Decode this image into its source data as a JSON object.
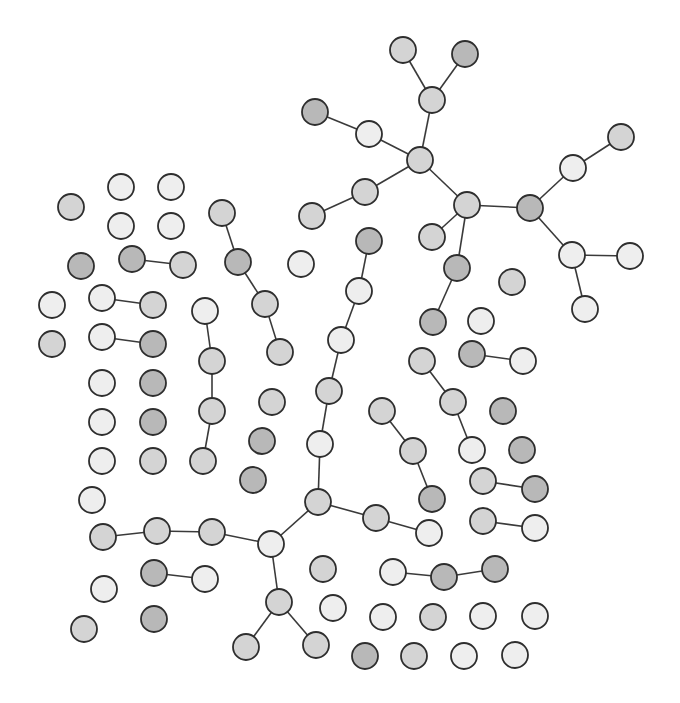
{
  "diagram": {
    "type": "network-graph",
    "width": 680,
    "height": 703,
    "node_radius": 13,
    "shades": {
      "light": "#eeeeee",
      "mid": "#d4d4d4",
      "dark": "#b8b8b8"
    },
    "nodes": [
      {
        "id": "n1",
        "x": 403,
        "y": 50,
        "shade": "mid"
      },
      {
        "id": "n2",
        "x": 465,
        "y": 54,
        "shade": "dark"
      },
      {
        "id": "n3",
        "x": 432,
        "y": 100,
        "shade": "mid"
      },
      {
        "id": "n4",
        "x": 315,
        "y": 112,
        "shade": "dark"
      },
      {
        "id": "n5",
        "x": 369,
        "y": 134,
        "shade": "light"
      },
      {
        "id": "n6",
        "x": 420,
        "y": 160,
        "shade": "mid"
      },
      {
        "id": "n7",
        "x": 621,
        "y": 137,
        "shade": "mid"
      },
      {
        "id": "n8",
        "x": 573,
        "y": 168,
        "shade": "light"
      },
      {
        "id": "n9",
        "x": 365,
        "y": 192,
        "shade": "mid"
      },
      {
        "id": "n10",
        "x": 467,
        "y": 205,
        "shade": "mid"
      },
      {
        "id": "n11",
        "x": 530,
        "y": 208,
        "shade": "dark"
      },
      {
        "id": "n12",
        "x": 312,
        "y": 216,
        "shade": "mid"
      },
      {
        "id": "n13",
        "x": 432,
        "y": 237,
        "shade": "mid"
      },
      {
        "id": "n14",
        "x": 572,
        "y": 255,
        "shade": "light"
      },
      {
        "id": "n15",
        "x": 630,
        "y": 256,
        "shade": "light"
      },
      {
        "id": "n16",
        "x": 457,
        "y": 268,
        "shade": "dark"
      },
      {
        "id": "n17",
        "x": 512,
        "y": 282,
        "shade": "mid"
      },
      {
        "id": "n18",
        "x": 585,
        "y": 309,
        "shade": "light"
      },
      {
        "id": "n19",
        "x": 433,
        "y": 322,
        "shade": "dark"
      },
      {
        "id": "n20",
        "x": 481,
        "y": 321,
        "shade": "light"
      },
      {
        "id": "n21",
        "x": 121,
        "y": 187,
        "shade": "light"
      },
      {
        "id": "n22",
        "x": 171,
        "y": 187,
        "shade": "light"
      },
      {
        "id": "n23",
        "x": 71,
        "y": 207,
        "shade": "mid"
      },
      {
        "id": "n24",
        "x": 121,
        "y": 226,
        "shade": "light"
      },
      {
        "id": "n25",
        "x": 171,
        "y": 226,
        "shade": "light"
      },
      {
        "id": "n26",
        "x": 222,
        "y": 213,
        "shade": "mid"
      },
      {
        "id": "n27",
        "x": 369,
        "y": 241,
        "shade": "dark"
      },
      {
        "id": "n28",
        "x": 81,
        "y": 266,
        "shade": "dark"
      },
      {
        "id": "n29",
        "x": 132,
        "y": 259,
        "shade": "dark"
      },
      {
        "id": "n30",
        "x": 183,
        "y": 265,
        "shade": "mid"
      },
      {
        "id": "n31",
        "x": 238,
        "y": 262,
        "shade": "dark"
      },
      {
        "id": "n32",
        "x": 301,
        "y": 264,
        "shade": "light"
      },
      {
        "id": "n33",
        "x": 359,
        "y": 291,
        "shade": "light"
      },
      {
        "id": "n34",
        "x": 52,
        "y": 305,
        "shade": "light"
      },
      {
        "id": "n35",
        "x": 102,
        "y": 298,
        "shade": "light"
      },
      {
        "id": "n36",
        "x": 153,
        "y": 305,
        "shade": "mid"
      },
      {
        "id": "n37",
        "x": 265,
        "y": 304,
        "shade": "mid"
      },
      {
        "id": "n38",
        "x": 205,
        "y": 311,
        "shade": "light"
      },
      {
        "id": "n39",
        "x": 52,
        "y": 344,
        "shade": "mid"
      },
      {
        "id": "n40",
        "x": 102,
        "y": 337,
        "shade": "light"
      },
      {
        "id": "n41",
        "x": 153,
        "y": 344,
        "shade": "dark"
      },
      {
        "id": "n42",
        "x": 341,
        "y": 340,
        "shade": "light"
      },
      {
        "id": "n43",
        "x": 280,
        "y": 352,
        "shade": "mid"
      },
      {
        "id": "n44",
        "x": 422,
        "y": 361,
        "shade": "mid"
      },
      {
        "id": "n45",
        "x": 472,
        "y": 354,
        "shade": "dark"
      },
      {
        "id": "n46",
        "x": 523,
        "y": 361,
        "shade": "light"
      },
      {
        "id": "n47",
        "x": 212,
        "y": 361,
        "shade": "mid"
      },
      {
        "id": "n48",
        "x": 102,
        "y": 383,
        "shade": "light"
      },
      {
        "id": "n49",
        "x": 153,
        "y": 383,
        "shade": "dark"
      },
      {
        "id": "n50",
        "x": 329,
        "y": 391,
        "shade": "mid"
      },
      {
        "id": "n51",
        "x": 272,
        "y": 402,
        "shade": "mid"
      },
      {
        "id": "n52",
        "x": 453,
        "y": 402,
        "shade": "mid"
      },
      {
        "id": "n53",
        "x": 382,
        "y": 411,
        "shade": "mid"
      },
      {
        "id": "n54",
        "x": 503,
        "y": 411,
        "shade": "dark"
      },
      {
        "id": "n55",
        "x": 212,
        "y": 411,
        "shade": "mid"
      },
      {
        "id": "n56",
        "x": 102,
        "y": 422,
        "shade": "light"
      },
      {
        "id": "n57",
        "x": 153,
        "y": 422,
        "shade": "dark"
      },
      {
        "id": "n58",
        "x": 262,
        "y": 441,
        "shade": "dark"
      },
      {
        "id": "n59",
        "x": 413,
        "y": 451,
        "shade": "mid"
      },
      {
        "id": "n60",
        "x": 320,
        "y": 444,
        "shade": "light"
      },
      {
        "id": "n61",
        "x": 522,
        "y": 450,
        "shade": "dark"
      },
      {
        "id": "n62",
        "x": 102,
        "y": 461,
        "shade": "light"
      },
      {
        "id": "n63",
        "x": 153,
        "y": 461,
        "shade": "mid"
      },
      {
        "id": "n64",
        "x": 203,
        "y": 461,
        "shade": "mid"
      },
      {
        "id": "n65",
        "x": 472,
        "y": 450,
        "shade": "light"
      },
      {
        "id": "n66",
        "x": 253,
        "y": 480,
        "shade": "dark"
      },
      {
        "id": "n67",
        "x": 483,
        "y": 481,
        "shade": "mid"
      },
      {
        "id": "n68",
        "x": 535,
        "y": 489,
        "shade": "dark"
      },
      {
        "id": "n69",
        "x": 92,
        "y": 500,
        "shade": "light"
      },
      {
        "id": "n70",
        "x": 318,
        "y": 502,
        "shade": "mid"
      },
      {
        "id": "n71",
        "x": 432,
        "y": 499,
        "shade": "dark"
      },
      {
        "id": "n72",
        "x": 376,
        "y": 518,
        "shade": "mid"
      },
      {
        "id": "n73",
        "x": 483,
        "y": 521,
        "shade": "mid"
      },
      {
        "id": "n74",
        "x": 535,
        "y": 528,
        "shade": "light"
      },
      {
        "id": "n75",
        "x": 103,
        "y": 537,
        "shade": "mid"
      },
      {
        "id": "n76",
        "x": 157,
        "y": 531,
        "shade": "mid"
      },
      {
        "id": "n77",
        "x": 212,
        "y": 532,
        "shade": "mid"
      },
      {
        "id": "n78",
        "x": 429,
        "y": 533,
        "shade": "light"
      },
      {
        "id": "n79",
        "x": 271,
        "y": 544,
        "shade": "light"
      },
      {
        "id": "n80",
        "x": 154,
        "y": 573,
        "shade": "dark"
      },
      {
        "id": "n81",
        "x": 205,
        "y": 579,
        "shade": "light"
      },
      {
        "id": "n82",
        "x": 323,
        "y": 569,
        "shade": "mid"
      },
      {
        "id": "n83",
        "x": 393,
        "y": 572,
        "shade": "light"
      },
      {
        "id": "n84",
        "x": 444,
        "y": 577,
        "shade": "dark"
      },
      {
        "id": "n85",
        "x": 495,
        "y": 569,
        "shade": "dark"
      },
      {
        "id": "n86",
        "x": 104,
        "y": 589,
        "shade": "light"
      },
      {
        "id": "n87",
        "x": 279,
        "y": 602,
        "shade": "mid"
      },
      {
        "id": "n88",
        "x": 333,
        "y": 608,
        "shade": "light"
      },
      {
        "id": "n89",
        "x": 383,
        "y": 617,
        "shade": "light"
      },
      {
        "id": "n90",
        "x": 433,
        "y": 617,
        "shade": "mid"
      },
      {
        "id": "n91",
        "x": 483,
        "y": 616,
        "shade": "light"
      },
      {
        "id": "n92",
        "x": 535,
        "y": 616,
        "shade": "light"
      },
      {
        "id": "n93",
        "x": 84,
        "y": 629,
        "shade": "mid"
      },
      {
        "id": "n94",
        "x": 154,
        "y": 619,
        "shade": "dark"
      },
      {
        "id": "n95",
        "x": 246,
        "y": 647,
        "shade": "mid"
      },
      {
        "id": "n96",
        "x": 316,
        "y": 645,
        "shade": "mid"
      },
      {
        "id": "n97",
        "x": 365,
        "y": 656,
        "shade": "dark"
      },
      {
        "id": "n98",
        "x": 414,
        "y": 656,
        "shade": "mid"
      },
      {
        "id": "n99",
        "x": 464,
        "y": 656,
        "shade": "light"
      },
      {
        "id": "n100",
        "x": 515,
        "y": 655,
        "shade": "light"
      }
    ],
    "edges": [
      [
        "n1",
        "n3"
      ],
      [
        "n2",
        "n3"
      ],
      [
        "n3",
        "n6"
      ],
      [
        "n4",
        "n5"
      ],
      [
        "n5",
        "n6"
      ],
      [
        "n6",
        "n9"
      ],
      [
        "n9",
        "n12"
      ],
      [
        "n6",
        "n10"
      ],
      [
        "n10",
        "n11"
      ],
      [
        "n10",
        "n13"
      ],
      [
        "n10",
        "n16"
      ],
      [
        "n16",
        "n19"
      ],
      [
        "n11",
        "n8"
      ],
      [
        "n8",
        "n7"
      ],
      [
        "n11",
        "n14"
      ],
      [
        "n14",
        "n15"
      ],
      [
        "n14",
        "n18"
      ],
      [
        "n29",
        "n30"
      ],
      [
        "n26",
        "n31"
      ],
      [
        "n31",
        "n37"
      ],
      [
        "n37",
        "n43"
      ],
      [
        "n35",
        "n36"
      ],
      [
        "n40",
        "n41"
      ],
      [
        "n38",
        "n47"
      ],
      [
        "n47",
        "n55"
      ],
      [
        "n55",
        "n64"
      ],
      [
        "n45",
        "n46"
      ],
      [
        "n44",
        "n52"
      ],
      [
        "n52",
        "n65"
      ],
      [
        "n53",
        "n59"
      ],
      [
        "n59",
        "n71"
      ],
      [
        "n67",
        "n68"
      ],
      [
        "n73",
        "n74"
      ],
      [
        "n27",
        "n33"
      ],
      [
        "n33",
        "n42"
      ],
      [
        "n42",
        "n50"
      ],
      [
        "n50",
        "n60"
      ],
      [
        "n60",
        "n70"
      ],
      [
        "n70",
        "n72"
      ],
      [
        "n72",
        "n78"
      ],
      [
        "n70",
        "n79"
      ],
      [
        "n75",
        "n76"
      ],
      [
        "n76",
        "n77"
      ],
      [
        "n77",
        "n79"
      ],
      [
        "n79",
        "n87"
      ],
      [
        "n87",
        "n95"
      ],
      [
        "n87",
        "n96"
      ],
      [
        "n80",
        "n81"
      ],
      [
        "n83",
        "n84"
      ],
      [
        "n84",
        "n85"
      ]
    ]
  }
}
